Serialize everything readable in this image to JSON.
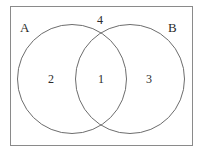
{
  "figure": {
    "type": "venn-diagram",
    "title": "",
    "universe_border_color": "#8a8a8a",
    "circle_border_color": "#6d6d6d",
    "text_color": "#2b2b2b",
    "background_color": "#ffffff"
  },
  "sets": {
    "left": {
      "label": "A"
    },
    "right": {
      "label": "B"
    }
  },
  "regions": {
    "a_only": {
      "label": "2"
    },
    "intersection": {
      "label": "1"
    },
    "b_only": {
      "label": "3"
    },
    "outside": {
      "label": "4"
    }
  },
  "chart_data": {
    "type": "venn",
    "title": "",
    "sets": [
      "A",
      "B"
    ],
    "categories": [
      "A only",
      "A and B",
      "B only",
      "Outside (neither)"
    ],
    "values": [
      2,
      1,
      3,
      4
    ],
    "labels": {
      "A": "A",
      "B": "B"
    },
    "annotations": [
      {
        "region": "a_only",
        "value": 2,
        "x": 52,
        "y": 79
      },
      {
        "region": "intersection",
        "value": 1,
        "x": 101,
        "y": 79
      },
      {
        "region": "b_only",
        "value": 3,
        "x": 150,
        "y": 79
      },
      {
        "region": "outside",
        "value": 4,
        "x": 101,
        "y": 19
      }
    ],
    "legend": "none",
    "grid": false
  }
}
